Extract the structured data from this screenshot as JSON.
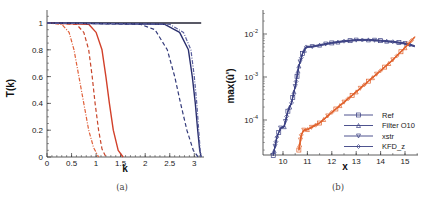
{
  "chart_data": [
    {
      "type": "line",
      "caption": "(a)",
      "title": "",
      "xlabel": "k",
      "ylabel": "T(k)",
      "xlim": [
        0,
        3.2
      ],
      "ylim": [
        0,
        1.1
      ],
      "xticks": [
        "0",
        "0.5",
        "1",
        "1.5",
        "2",
        "2.5",
        "3"
      ],
      "yticks": [
        "0",
        "0.2",
        "0.4",
        "0.6",
        "0.8",
        "1"
      ],
      "grid": false,
      "series": [
        {
          "name": "unity",
          "color": "#222233",
          "style": "solid",
          "x": [
            0,
            3.14
          ],
          "y": [
            1,
            1
          ]
        },
        {
          "name": "red-dashdot",
          "color": "#e0603a",
          "style": "dashdot",
          "x": [
            0,
            0.3,
            0.45,
            0.55,
            0.65,
            0.75,
            0.85,
            0.95,
            1.05
          ],
          "y": [
            1,
            0.99,
            0.93,
            0.8,
            0.6,
            0.4,
            0.2,
            0.07,
            0
          ]
        },
        {
          "name": "red-dashed",
          "color": "#c8452a",
          "style": "dashed",
          "x": [
            0,
            0.6,
            0.75,
            0.85,
            0.92,
            0.98,
            1.05,
            1.12,
            1.2
          ],
          "y": [
            1,
            0.99,
            0.93,
            0.8,
            0.6,
            0.4,
            0.2,
            0.06,
            0
          ]
        },
        {
          "name": "red-solid",
          "color": "#d2402a",
          "style": "solid",
          "x": [
            0,
            0.85,
            1.0,
            1.12,
            1.2,
            1.27,
            1.35,
            1.45,
            1.55
          ],
          "y": [
            1,
            0.99,
            0.93,
            0.8,
            0.6,
            0.4,
            0.2,
            0.05,
            0
          ]
        },
        {
          "name": "blue-dashed",
          "color": "#333a7a",
          "style": "dashed",
          "x": [
            0,
            1.9,
            2.2,
            2.45,
            2.6,
            2.72,
            2.85,
            2.98,
            3.08
          ],
          "y": [
            1,
            0.99,
            0.95,
            0.8,
            0.6,
            0.4,
            0.2,
            0.05,
            0
          ]
        },
        {
          "name": "blue-solid",
          "color": "#2a2f6e",
          "style": "solid",
          "x": [
            0,
            2.4,
            2.7,
            2.88,
            2.96,
            3.02,
            3.07,
            3.11,
            3.14
          ],
          "y": [
            1,
            0.99,
            0.93,
            0.8,
            0.6,
            0.4,
            0.2,
            0.05,
            0
          ]
        },
        {
          "name": "blue-dashdot",
          "color": "#5a5f9e",
          "style": "dashdot",
          "x": [
            0,
            2.5,
            2.78,
            2.93,
            3.0,
            3.05,
            3.09,
            3.12,
            3.14
          ],
          "y": [
            1,
            0.99,
            0.93,
            0.8,
            0.6,
            0.4,
            0.2,
            0.05,
            0
          ]
        }
      ]
    },
    {
      "type": "line",
      "caption": "(b)",
      "title": "",
      "xlabel": "x",
      "ylabel": "max(û')",
      "xlim": [
        9.2,
        15.5
      ],
      "ylim": [
        1.5e-05,
        0.045
      ],
      "yscale": "log",
      "xticks": [
        "10",
        "11",
        "12",
        "13",
        "14",
        "15"
      ],
      "yticks": [
        "10^-4",
        "10^-3",
        "10^-2"
      ],
      "grid": false,
      "legend": {
        "position": "lower right",
        "entries": [
          {
            "label": "Ref",
            "marker": "square"
          },
          {
            "label": "Filter O10",
            "marker": "triangle-up"
          },
          {
            "label": "xstr",
            "marker": "triangle-down"
          },
          {
            "label": "KFD_z",
            "marker": "diamond"
          }
        ]
      },
      "series": [
        {
          "name": "blue-group",
          "color": "#3a3f82",
          "x": [
            9.6,
            9.75,
            9.9,
            10.05,
            10.2,
            10.35,
            10.5,
            10.65,
            10.8,
            10.95,
            11.2,
            11.5,
            12,
            12.5,
            13,
            13.5,
            14,
            14.5,
            15,
            15.4
          ],
          "y": [
            1.5e-05,
            4e-05,
            6.5e-05,
            7e-05,
            0.00016,
            0.00025,
            0.0006,
            0.0018,
            0.0035,
            0.005,
            0.0051,
            0.0055,
            0.0062,
            0.0068,
            0.0072,
            0.0073,
            0.007,
            0.0066,
            0.006,
            0.0052
          ]
        },
        {
          "name": "orange-group",
          "color": "#e0602a",
          "x": [
            10.65,
            10.75,
            10.85,
            11.0,
            11.5,
            12,
            12.5,
            13,
            13.5,
            14,
            14.5,
            15,
            15.4
          ],
          "y": [
            2e-05,
            4.5e-05,
            5.8e-05,
            6e-05,
            8.5e-05,
            0.00015,
            0.00026,
            0.00045,
            0.0008,
            0.0014,
            0.0025,
            0.0048,
            0.0085
          ]
        }
      ]
    }
  ]
}
